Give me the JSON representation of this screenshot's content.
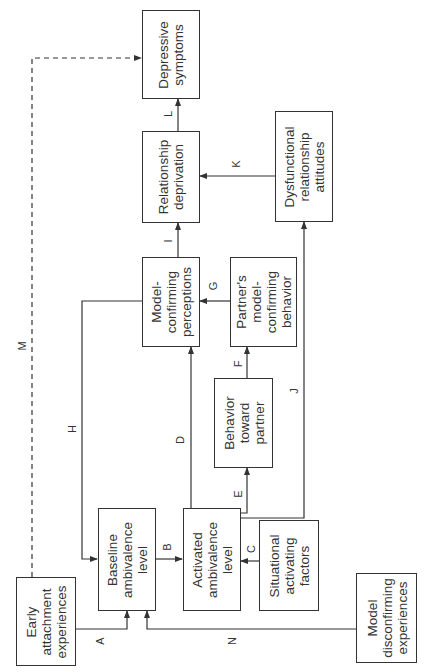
{
  "diagram": {
    "nodes": {
      "early_attachment": {
        "label": "Early\nattachment\nexperiences"
      },
      "baseline_ambivalence": {
        "label": "Baseline\nambivalence\nlevel"
      },
      "activated_ambivalence": {
        "label": "Activated\nambivalence\nlevel"
      },
      "situational_factors": {
        "label": "Situational\nactivating\nfactors"
      },
      "model_disconfirming": {
        "label": "Model\ndisconfirming\nexperiences"
      },
      "behavior_toward_partner": {
        "label": "Behavior\ntoward\npartner"
      },
      "model_confirming_perceptions": {
        "label": "Model-\nconfirming\nperceptions"
      },
      "partner_behavior": {
        "label": "Partner's\nmodel-\nconfirming\nbehavior"
      },
      "relationship_deprivation": {
        "label": "Relationship\ndeprivation"
      },
      "dysfunctional_attitudes": {
        "label": "Dysfunctional\nrelationship\nattitudes"
      },
      "depressive_symptoms": {
        "label": "Depressive\nsymptoms"
      }
    },
    "edges": {
      "A": {
        "label": "A",
        "from": "Early attachment experiences",
        "to": "Baseline ambivalence level"
      },
      "B": {
        "label": "B",
        "from": "Baseline ambivalence level",
        "to": "Activated ambivalence level"
      },
      "C": {
        "label": "C",
        "from": "Situational activating factors",
        "to": "Activated ambivalence level"
      },
      "D": {
        "label": "D",
        "from": "Activated ambivalence level",
        "to": "Model-confirming perceptions"
      },
      "E": {
        "label": "E",
        "from": "Activated ambivalence level",
        "to": "Behavior toward partner"
      },
      "F": {
        "label": "F",
        "from": "Behavior toward partner",
        "to": "Partner's model-confirming behavior"
      },
      "G": {
        "label": "G",
        "from": "Partner's model-confirming behavior",
        "to": "Model-confirming perceptions"
      },
      "H": {
        "label": "H",
        "from": "Model-confirming perceptions",
        "to": "Baseline ambivalence level"
      },
      "I": {
        "label": "I",
        "from": "Model-confirming perceptions",
        "to": "Relationship deprivation"
      },
      "J": {
        "label": "J",
        "from": "Activated ambivalence level",
        "to": "Dysfunctional relationship attitudes"
      },
      "K": {
        "label": "K",
        "from": "Dysfunctional relationship attitudes",
        "to": "Relationship deprivation"
      },
      "L": {
        "label": "L",
        "from": "Relationship deprivation",
        "to": "Depressive symptoms"
      },
      "M": {
        "label": "M",
        "from": "Early attachment experiences",
        "to": "Depressive symptoms",
        "style": "dashed"
      },
      "N": {
        "label": "N",
        "from": "Model disconfirming experiences",
        "to": "Baseline ambivalence level"
      }
    },
    "colors": {
      "stroke": "#333333",
      "background": "#ffffff"
    }
  }
}
